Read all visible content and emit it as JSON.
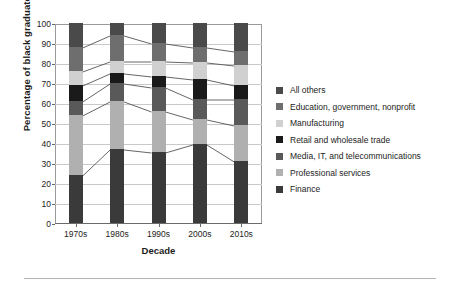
{
  "chart_data": {
    "type": "bar",
    "subtype": "stacked-bar-100",
    "title": "",
    "xlabel": "Decade",
    "ylabel": "Percentage of black graduates",
    "categories": [
      "1970s",
      "1980s",
      "1990s",
      "2000s",
      "2010s"
    ],
    "ylim": [
      0,
      100
    ],
    "yticks": [
      0,
      10,
      20,
      30,
      40,
      50,
      60,
      70,
      80,
      90,
      100
    ],
    "ytick_labels": [
      "0",
      "10",
      "20",
      "30",
      "40",
      "50",
      "60",
      "70",
      "80",
      "90",
      "100"
    ],
    "grid": true,
    "legend_position": "right",
    "stack_order_bottom_to_top": [
      "Finance",
      "Professional services",
      "Media, IT, and telecommunications",
      "Retail and wholesale trade",
      "Manufacturing",
      "Education, government, nonprofit",
      "All others"
    ],
    "series": [
      {
        "name": "Finance",
        "color": "#3a3a3a",
        "values": [
          24,
          37,
          35.5,
          39.5,
          31
        ]
      },
      {
        "name": "Professional services",
        "color": "#b0b0b0",
        "values": [
          30,
          24,
          20.5,
          12.5,
          18
        ]
      },
      {
        "name": "Media, IT, and telecommunications",
        "color": "#595959",
        "values": [
          7,
          9,
          12,
          10,
          13
        ]
      },
      {
        "name": "Retail and wholesale trade",
        "color": "#1a1a1a",
        "values": [
          8,
          5,
          5.5,
          10,
          7
        ]
      },
      {
        "name": "Manufacturing",
        "color": "#d0d0d0",
        "values": [
          7,
          6,
          7.5,
          8.5,
          10
        ]
      },
      {
        "name": "Education, government, nonprofit",
        "color": "#6e6e6e",
        "values": [
          12,
          13,
          9,
          7.5,
          7
        ]
      },
      {
        "name": "All others",
        "color": "#4a4a4a",
        "values": [
          12,
          6,
          10,
          12,
          14
        ]
      }
    ],
    "cumulative_boundaries": {
      "1970s": [
        0,
        24,
        54,
        61,
        69,
        76,
        88,
        100
      ],
      "1980s": [
        0,
        37,
        61,
        70,
        75,
        81,
        94,
        100
      ],
      "1990s": [
        0,
        35.5,
        56,
        68,
        73.5,
        81,
        90,
        100
      ],
      "2000s": [
        0,
        39.5,
        52,
        62,
        72,
        80.5,
        88,
        100
      ],
      "2010s": [
        0,
        31,
        49,
        62,
        69,
        79,
        86,
        100
      ]
    }
  },
  "legend": {
    "items": [
      {
        "label": "All others",
        "color": "#4a4a4a"
      },
      {
        "label": "Education, government, nonprofit",
        "color": "#6e6e6e"
      },
      {
        "label": "Manufacturing",
        "color": "#d0d0d0"
      },
      {
        "label": "Retail and wholesale trade",
        "color": "#1a1a1a"
      },
      {
        "label": "Media, IT, and telecommunications",
        "color": "#595959"
      },
      {
        "label": "Professional services",
        "color": "#b0b0b0"
      },
      {
        "label": "Finance",
        "color": "#3a3a3a"
      }
    ]
  },
  "axes": {
    "y_title": "Percentage of black graduates",
    "x_title": "Decade"
  },
  "colors": {
    "grid": "#c9c9c9",
    "axis": "#6b6b6b",
    "text": "#1d1d1d",
    "connector": "#555555",
    "background": "#ffffff",
    "footer_rule": "#b4b4b4"
  }
}
